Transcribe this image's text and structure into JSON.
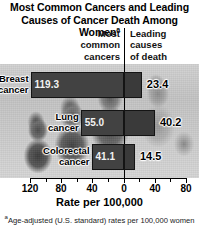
{
  "title": {
    "line1": "Most Common Cancers and Leading",
    "line2": "Causes of Cancer Death Among Women",
    "marker": "a"
  },
  "columns": {
    "left_header": "Most\ncommon\ncancers",
    "right_header": "Leading\ncauses\nof death"
  },
  "axis": {
    "title": "Rate per 100,000",
    "tick_labels": [
      "120",
      "80",
      "40",
      "0",
      "40",
      "80"
    ]
  },
  "footnote": {
    "marker": "a",
    "text": "Age-adjusted (U.S. standard) rates per 100,000 women"
  },
  "rows": [
    {
      "label": "Breast\ncancer",
      "incidence": "119.3",
      "mortality": "23.4"
    },
    {
      "label": "Lung\ncancer",
      "incidence": "55.0",
      "mortality": "40.2"
    },
    {
      "label": "Colorectal\ncancer",
      "incidence": "41.1",
      "mortality": "14.5"
    }
  ],
  "colors": {
    "bar": "#3b3b3b",
    "bar_outline": "#141414",
    "axis": "#000000",
    "inside_value_text": "#f2f2f2",
    "outside_value_text": "#000000",
    "background": "#ffffff"
  },
  "chart_data": {
    "type": "bar",
    "title": "Most Common Cancers and Leading Causes of Cancer Death Among Women",
    "subtitle": "",
    "orientation": "horizontal",
    "style": "back-to-back (bidirectional) bar chart",
    "categories": [
      "Breast cancer",
      "Lung cancer",
      "Colorectal cancer"
    ],
    "series": [
      {
        "name": "Most common cancers",
        "direction": "left",
        "values": [
          119.3,
          55.0,
          41.1
        ]
      },
      {
        "name": "Leading causes of death",
        "direction": "right",
        "values": [
          23.4,
          40.2,
          14.5
        ]
      }
    ],
    "xlabel": "Rate per 100,000",
    "ylabel": "",
    "xticks_left": [
      120,
      80,
      40,
      0
    ],
    "xticks_right": [
      0,
      40,
      80
    ],
    "xlim_left": [
      0,
      120
    ],
    "xlim_right": [
      0,
      80
    ],
    "grid": false,
    "legend": "column headers above chart",
    "annotations": [
      "Age-adjusted (U.S. standard) rates per 100,000 women"
    ],
    "background_image": "grayscale photograph of women behind plot area"
  }
}
